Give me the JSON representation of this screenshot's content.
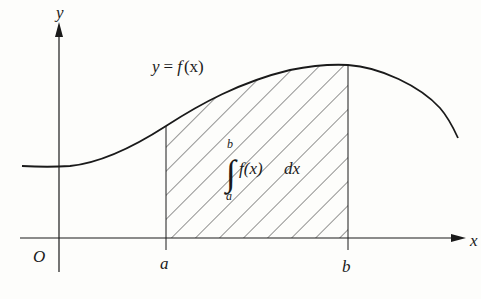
{
  "diagram": {
    "type": "definite-integral-area",
    "axes": {
      "x_label": "x",
      "y_label": "y",
      "origin_label": "O"
    },
    "curve": {
      "label": "y = f(x)",
      "label_parts": {
        "lhs": "y",
        "eq": "=",
        "fn": "f",
        "arg": "(x)"
      }
    },
    "bounds": {
      "lower": "a",
      "upper": "b"
    },
    "region": {
      "fill": "hatched",
      "integral_expression": "∫ₐᵇ f(x) dx",
      "integral_parts": {
        "sign": "∫",
        "upper": "b",
        "lower": "a",
        "integrand": "f(x)",
        "differential": "dx"
      }
    },
    "colors": {
      "ink": "#1a1a1a",
      "background": "#fdfdfb"
    }
  }
}
